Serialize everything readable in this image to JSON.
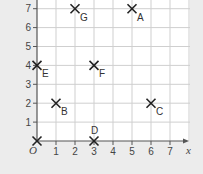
{
  "chart_data": {
    "type": "scatter",
    "title": "",
    "xlabel": "x",
    "ylabel": "",
    "origin_label": "O",
    "xlim": [
      0,
      8
    ],
    "ylim": [
      0,
      7.5
    ],
    "grid": true,
    "legend": null,
    "x_ticks": [
      "1",
      "2",
      "3",
      "4",
      "5",
      "6",
      "7"
    ],
    "y_ticks": [
      "1",
      "2",
      "3",
      "4",
      "5",
      "6",
      "7"
    ],
    "marker": "cross",
    "points": [
      {
        "label": "A",
        "x": 5,
        "y": 7
      },
      {
        "label": "B",
        "x": 1,
        "y": 2
      },
      {
        "label": "C",
        "x": 6,
        "y": 2
      },
      {
        "label": "D",
        "x": 3,
        "y": 0
      },
      {
        "label": "E",
        "x": 0,
        "y": 4
      },
      {
        "label": "F",
        "x": 3,
        "y": 4
      },
      {
        "label": "G",
        "x": 2,
        "y": 7
      },
      {
        "label": "",
        "x": 0,
        "y": 0
      }
    ]
  },
  "colors": {
    "background": "#ececec",
    "plot_area": "#ffffff",
    "grid": "#cfcfcf",
    "axis": "#555555",
    "marker": "#222222"
  }
}
